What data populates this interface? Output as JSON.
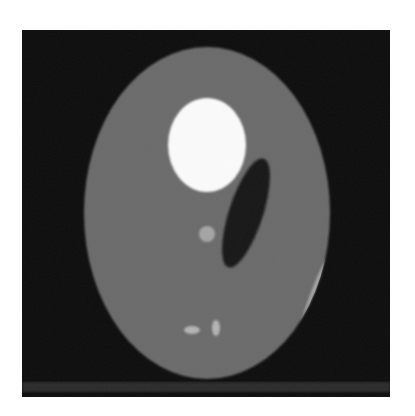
{
  "figure": {
    "canvas": {
      "width": 415,
      "height": 416,
      "background": "#ffffff"
    },
    "frame": {
      "x": 22,
      "y": 30,
      "width": 368,
      "height": 367,
      "color": "#0c0c0c"
    },
    "bottom_band": {
      "y": 352,
      "height": 10,
      "color": "#2b2b2b"
    },
    "shapes": [
      {
        "name": "outer-ellipse",
        "cx": 185,
        "cy": 183,
        "rx": 123,
        "ry": 166,
        "rotate": 0,
        "color": "#6b6b6b"
      },
      {
        "name": "bright-ellipse",
        "cx": 185,
        "cy": 115,
        "rx": 39,
        "ry": 47,
        "rotate": 0,
        "color": "#fbfbfb"
      },
      {
        "name": "dark-ellipse",
        "cx": 224,
        "cy": 183,
        "rx": 17,
        "ry": 57,
        "rotate": 18,
        "color": "#141414"
      },
      {
        "name": "small-circle",
        "cx": 185,
        "cy": 204,
        "rx": 8,
        "ry": 8,
        "rotate": 0,
        "color": "#a5a5a5"
      },
      {
        "name": "small-horizontal-ellipse",
        "cx": 170,
        "cy": 300,
        "rx": 8,
        "ry": 4,
        "rotate": 0,
        "color": "#b3b3b3"
      },
      {
        "name": "small-vertical-ellipse",
        "cx": 194,
        "cy": 298,
        "rx": 4,
        "ry": 8,
        "rotate": 0,
        "color": "#b3b3b3"
      }
    ],
    "crescent": {
      "color": "#a6a6a6"
    },
    "caption": {
      "text": "",
      "note": "caption clipped at image bottom edge; not legible"
    }
  }
}
